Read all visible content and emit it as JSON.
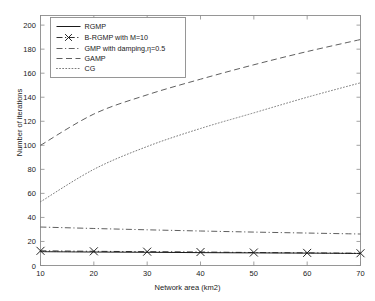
{
  "chart_data": {
    "type": "line",
    "title": "",
    "xlabel": "Network area (km2)",
    "ylabel": "Number of iterations",
    "xlim": [
      10,
      70
    ],
    "ylim": [
      0,
      208
    ],
    "xticks": [
      10,
      20,
      30,
      40,
      50,
      60,
      70
    ],
    "yticks": [
      0,
      20,
      40,
      60,
      80,
      100,
      120,
      140,
      160,
      180,
      200
    ],
    "grid": false,
    "legend_position": "upper left",
    "x": [
      10,
      20,
      30,
      40,
      50,
      60,
      70
    ],
    "series": [
      {
        "name": "RGMP",
        "style": "solid",
        "marker": "none",
        "color": "#1a1a1a",
        "values": [
          11.5,
          11.2,
          11.0,
          10.7,
          10.5,
          10.3,
          10.0
        ]
      },
      {
        "name": "B-RGMP with M=10",
        "style": "dashdot",
        "marker": "x",
        "color": "#1a1a1a",
        "values": [
          12.2,
          11.8,
          11.5,
          11.2,
          10.8,
          10.5,
          10.2
        ]
      },
      {
        "name": "GMP with damping,η=0.5",
        "style": "dashdot",
        "marker": "none",
        "color": "#4d4d4d",
        "values": [
          32.0,
          30.8,
          29.7,
          28.7,
          27.8,
          27.0,
          26.2
        ]
      },
      {
        "name": "GAMP",
        "style": "dashed",
        "marker": "none",
        "color": "#4d4d4d",
        "values": [
          100,
          126,
          142,
          155,
          167,
          178,
          188
        ]
      },
      {
        "name": "CG",
        "style": "dotted",
        "marker": "none",
        "color": "#6b6b6b",
        "values": [
          53,
          80,
          99,
          114,
          127,
          140,
          152
        ]
      }
    ]
  },
  "axis": {
    "xlabel": "Network area (km2)",
    "ylabel": "Number of iterations",
    "xtick_labels": [
      "10",
      "20",
      "30",
      "40",
      "50",
      "60",
      "70"
    ],
    "ytick_labels": [
      "0",
      "20",
      "40",
      "60",
      "80",
      "100",
      "120",
      "140",
      "160",
      "180",
      "200"
    ]
  },
  "legend": {
    "items": [
      {
        "label": "RGMP"
      },
      {
        "label": "B-RGMP with M=10"
      },
      {
        "label": "GMP with damping,η=0.5"
      },
      {
        "label": "GAMP"
      },
      {
        "label": "CG"
      }
    ]
  }
}
